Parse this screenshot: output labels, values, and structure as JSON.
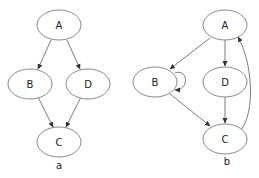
{
  "diagrams": [
    {
      "caption": "a",
      "nodes": [
        {
          "id": "A",
          "label": "A"
        },
        {
          "id": "B",
          "label": "B"
        },
        {
          "id": "D",
          "label": "D"
        },
        {
          "id": "C",
          "label": "C"
        }
      ],
      "edges": [
        {
          "from": "A",
          "to": "B"
        },
        {
          "from": "A",
          "to": "D"
        },
        {
          "from": "B",
          "to": "C"
        },
        {
          "from": "D",
          "to": "C"
        }
      ]
    },
    {
      "caption": "b",
      "nodes": [
        {
          "id": "A",
          "label": "A"
        },
        {
          "id": "B",
          "label": "B"
        },
        {
          "id": "D",
          "label": "D"
        },
        {
          "id": "C",
          "label": "C"
        }
      ],
      "edges": [
        {
          "from": "A",
          "to": "B"
        },
        {
          "from": "A",
          "to": "D"
        },
        {
          "from": "B",
          "to": "B",
          "type": "self-loop"
        },
        {
          "from": "B",
          "to": "C"
        },
        {
          "from": "D",
          "to": "C"
        },
        {
          "from": "C",
          "to": "A",
          "type": "curved"
        }
      ]
    }
  ],
  "colors": {
    "node_stroke": "#7a7a7a",
    "edge": "#5a5a5a",
    "text": "#222222"
  }
}
